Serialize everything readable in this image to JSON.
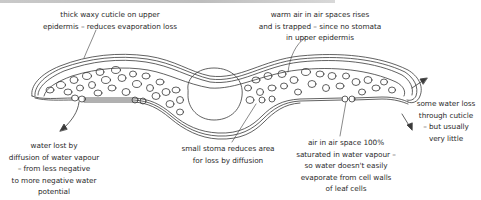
{
  "diagram": {
    "colors": {
      "line": "#3a3a3a",
      "text": "#2b2b2b",
      "top_bar": "#c4c4c4",
      "background": "#ffffff"
    },
    "labels": {
      "cuticle": [
        "thick waxy cuticle on upper",
        "epidermis – reduces evaporation loss"
      ],
      "warm_air": [
        "warm air in air spaces rises",
        "and is trapped – since no stomata",
        "in upper epidermis"
      ],
      "water_lost": [
        "water lost by",
        "diffusion of water vapour",
        "– from less negative",
        "to more negative water",
        "potential"
      ],
      "small_stoma": [
        "small stoma reduces area",
        "for loss by diffusion"
      ],
      "air_space": [
        "air in air space 100%",
        "saturated in water vapour –",
        "so water doesn't easily",
        "evaporate from cell walls",
        "of leaf cells"
      ],
      "some_water_loss": [
        "some water loss",
        "through cuticle",
        "– but usually",
        "very little"
      ]
    },
    "structures": [
      "upper-epidermis-cuticle",
      "lower-epidermis",
      "spongy-mesophyll-cells",
      "midrib-vascular-bundle",
      "stomata",
      "air-spaces"
    ]
  }
}
